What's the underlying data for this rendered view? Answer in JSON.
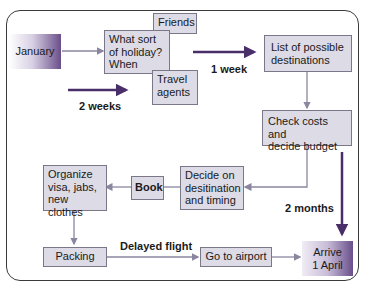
{
  "diagram": {
    "nodes": {
      "january": "January",
      "what_sort_1": "What sort",
      "what_sort_2": "of holiday?",
      "what_sort_3": "When",
      "friends": "Friends",
      "travel_1": "Travel",
      "travel_2": "agents",
      "list_1": "List of possible",
      "list_2": "destinations",
      "check_1": "Check costs and",
      "check_2": "decide budget",
      "decide_1": "Decide on",
      "decide_2": "desitination",
      "decide_3": "and timing",
      "book": "Book",
      "organize_1": "Organize",
      "organize_2": "visa, jabs,",
      "organize_3": "new clothes",
      "packing": "Packing",
      "airport": "Go to airport",
      "arrive_1": "Arrive",
      "arrive_2": "1 April"
    },
    "labels": {
      "two_weeks": "2 weeks",
      "one_week": "1 week",
      "two_months": "2 months",
      "delayed": "Delayed flight"
    },
    "colors": {
      "box_fill": "#dcdbe6",
      "box_border": "#7a7888",
      "arrow": "#8a86a0",
      "thick_arrow": "#4a2e6a",
      "gradient_dark": "#6a4f8a"
    }
  }
}
